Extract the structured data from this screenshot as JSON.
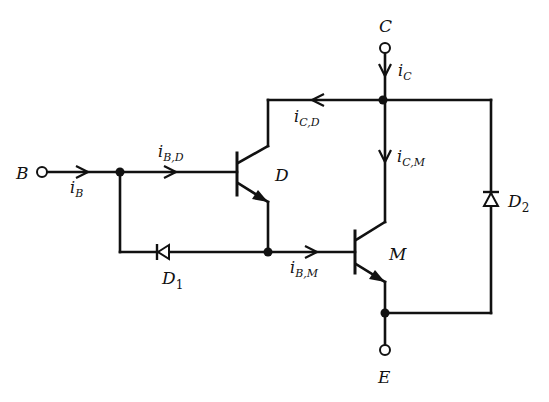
{
  "diagram": {
    "terminals": {
      "base": "B",
      "collector": "C",
      "emitter": "E"
    },
    "transistors": {
      "driver": "D",
      "main": "M"
    },
    "diodes": {
      "d1": {
        "main": "D",
        "sub": "1"
      },
      "d2": {
        "main": "D",
        "sub": "2"
      }
    },
    "currents": {
      "iB": {
        "main": "i",
        "sub": "B"
      },
      "iBD": {
        "main": "i",
        "sub": "B,D"
      },
      "iCD": {
        "main": "i",
        "sub": "C,D"
      },
      "iC": {
        "main": "i",
        "sub": "C"
      },
      "iCM": {
        "main": "i",
        "sub": "C,M"
      },
      "iBM": {
        "main": "i",
        "sub": "B,M"
      }
    },
    "colors": {
      "line": "#111111",
      "background": "#ffffff"
    }
  }
}
